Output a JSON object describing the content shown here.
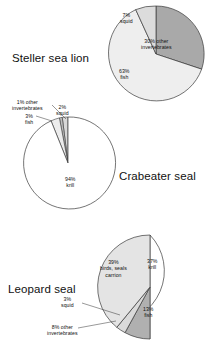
{
  "figure": {
    "background": "#ffffff",
    "colors": {
      "dark_gray": "#a9a9a9",
      "mid_gray": "#c9c9c9",
      "light_gray": "#e9e9e9",
      "very_light_gray": "#f2f2f2",
      "outline": "#3a3a3a",
      "text": "#111111"
    }
  },
  "charts": [
    {
      "id": "steller-sea-lion",
      "species": "Steller sea lion",
      "type": "pie",
      "categories": [
        "other invertebrates",
        "fish",
        "squid"
      ],
      "values": [
        30,
        63,
        7
      ],
      "slices": [
        {
          "label_pct": "30%",
          "label_name": "other invertebrates",
          "value": 30,
          "color": "#a9a9a9"
        },
        {
          "label_pct": "63%",
          "label_name": "fish",
          "value": 63,
          "color": "#eeeeee"
        },
        {
          "label_pct": "7%",
          "label_name": "squid",
          "value": 7,
          "color": "#dcdcdc"
        }
      ]
    },
    {
      "id": "crabeater-seal",
      "species": "Crabeater seal",
      "type": "pie",
      "categories": [
        "krill",
        "fish",
        "other invertebrates",
        "squid"
      ],
      "values": [
        94,
        3,
        1,
        2
      ],
      "slices": [
        {
          "label_pct": "94%",
          "label_name": "krill",
          "value": 94,
          "color": "#ffffff"
        },
        {
          "label_pct": "3%",
          "label_name": "fish",
          "value": 3,
          "color": "#ececec"
        },
        {
          "label_pct": "1%",
          "label_name": "other invertebrates",
          "value": 1,
          "color": "#bdbdbd"
        },
        {
          "label_pct": "2%",
          "label_name": "squid",
          "value": 2,
          "color": "#d8d8d8"
        }
      ]
    },
    {
      "id": "leopard-seal",
      "species": "Leopard seal",
      "type": "pie",
      "categories": [
        "krill",
        "fish",
        "other invertebrates",
        "squid",
        "birds, seals carrion"
      ],
      "values": [
        37,
        13,
        8,
        3,
        39
      ],
      "slices": [
        {
          "label_pct": "37%",
          "label_name": "krill",
          "value": 37,
          "color": "#ffffff"
        },
        {
          "label_pct": "13%",
          "label_name": "fish",
          "value": 13,
          "color": "#ececec"
        },
        {
          "label_pct": "8%",
          "label_name": "other invertebrates",
          "value": 8,
          "color": "#b0b0b0"
        },
        {
          "label_pct": "3%",
          "label_name": "squid",
          "value": 3,
          "color": "#dadada"
        },
        {
          "label_pct": "39%",
          "label_name": "birds, seals carrion",
          "value": 39,
          "color": "#e4e4e4"
        }
      ]
    }
  ],
  "labels": {
    "steller": "Steller sea lion",
    "crabeater": "Crabeater seal",
    "leopard": "Leopard seal",
    "c1_squid": "7%\nsquid",
    "c1_other": "30% other\ninvertebrates",
    "c1_fish": "63%\nfish",
    "c2_other": "1% other\ninvertebrates",
    "c2_squid": "2%\nsquid",
    "c2_fish": "3%\nfish",
    "c2_krill": "94%\nkrill",
    "c3_krill": "37%\nkrill",
    "c3_birds": "39%\nbirds, seals\ncarrion",
    "c3_fish": "13%\nfish",
    "c3_squid": "3%\nsquid",
    "c3_other": "8% other\ninvertebrates"
  },
  "chart_data": [
    {
      "type": "pie",
      "title": "Steller sea lion",
      "categories": [
        "other invertebrates",
        "fish",
        "squid"
      ],
      "values": [
        30,
        63,
        7
      ],
      "unit": "percent",
      "legend": "none",
      "data_labels": [
        "30% other invertebrates",
        "63% fish",
        "7% squid"
      ]
    },
    {
      "type": "pie",
      "title": "Crabeater seal",
      "categories": [
        "krill",
        "fish",
        "other invertebrates",
        "squid"
      ],
      "values": [
        94,
        3,
        1,
        2
      ],
      "unit": "percent",
      "legend": "none",
      "data_labels": [
        "94% krill",
        "3% fish",
        "1% other invertebrates",
        "2% squid"
      ]
    },
    {
      "type": "pie",
      "title": "Leopard seal",
      "categories": [
        "krill",
        "fish",
        "other invertebrates",
        "squid",
        "birds, seals carrion"
      ],
      "values": [
        37,
        13,
        8,
        3,
        39
      ],
      "unit": "percent",
      "legend": "none",
      "data_labels": [
        "37% krill",
        "13% fish",
        "8% other invertebrates",
        "3% squid",
        "39% birds, seals carrion"
      ]
    }
  ]
}
